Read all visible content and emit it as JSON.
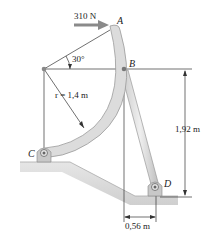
{
  "figure": {
    "force": {
      "label": "310 N",
      "color": "#8a8a8a"
    },
    "points": {
      "A": "A",
      "B": "B",
      "C": "C",
      "D": "D"
    },
    "angle": {
      "label": "30°"
    },
    "radius": {
      "label": "r = 1,4 m"
    },
    "dimensions": {
      "vertical": "1,92 m",
      "horizontal": "0,56 m"
    },
    "colors": {
      "member_fill": "#d9d9d9",
      "member_edge": "#9a9a9a",
      "ground_fill": "#d4d4d4",
      "line": "#333333"
    }
  }
}
